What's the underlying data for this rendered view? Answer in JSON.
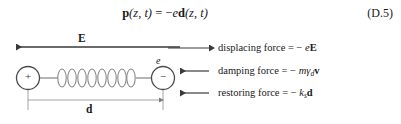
{
  "equation": {
    "lhs_vector": "p",
    "lhs_args": "(z, t)",
    "equals": "=",
    "rhs_sign": "−",
    "rhs_scalar": "e",
    "rhs_vector": "d",
    "rhs_args": "(z, t)",
    "number": "(D.5)"
  },
  "diagram": {
    "field_label": "E",
    "charge_label": "e",
    "positive_sign": "+",
    "negative_sign": "−",
    "displacement_label": "d",
    "forces": [
      {
        "name": "displacing",
        "text": "displacing force = − eE",
        "prefix": "displacing force = − ",
        "scalar": "e",
        "vector": "E",
        "subscript": "",
        "arrow_direction": "right"
      },
      {
        "name": "damping",
        "text": "damping force = − mγd v",
        "prefix": "damping force = − ",
        "scalar": "mγ",
        "vector": "v",
        "subscript": "d",
        "arrow_direction": "left"
      },
      {
        "name": "restoring",
        "text": "restoring force = − ks d",
        "prefix": "restoring force = − ",
        "scalar": "k",
        "vector": "d",
        "subscript": "s",
        "arrow_direction": "left"
      }
    ]
  },
  "colors": {
    "background": "#ffffff",
    "ink": "#1a1a1a",
    "line": "#444444",
    "thin_line": "#8a8a8a"
  }
}
